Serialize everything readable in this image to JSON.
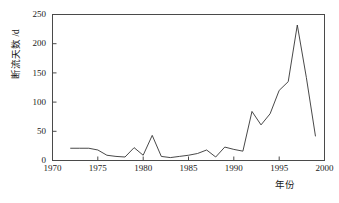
{
  "chart_data": {
    "type": "line",
    "title": "",
    "subtitle": "",
    "xlabel": "年份",
    "ylabel": "断流天数 /d",
    "xlim": [
      1970,
      2000
    ],
    "ylim": [
      0,
      250
    ],
    "grid": false,
    "legend": null,
    "xticks": [
      "1970",
      "1975",
      "1980",
      "1985",
      "1990",
      "1995",
      "2000"
    ],
    "xtick_values": [
      1970,
      1975,
      1980,
      1985,
      1990,
      1995,
      2000
    ],
    "yticks": [
      "0",
      "50",
      "100",
      "150",
      "200",
      "250"
    ],
    "ytick_values": [
      0,
      50,
      100,
      150,
      200,
      250
    ],
    "line_color": "#333333",
    "series": [
      {
        "name": "断流天数",
        "x": [
          1972,
          1973,
          1974,
          1975,
          1976,
          1977,
          1978,
          1979,
          1980,
          1981,
          1982,
          1983,
          1984,
          1985,
          1986,
          1987,
          1988,
          1989,
          1990,
          1991,
          1992,
          1993,
          1994,
          1995,
          1996,
          1997,
          1998,
          1999
        ],
        "values": [
          21,
          21,
          21,
          18,
          9,
          7,
          6,
          22,
          9,
          43,
          7,
          5,
          7,
          9,
          12,
          18,
          6,
          23,
          19,
          16,
          84,
          61,
          80,
          120,
          135,
          232,
          142,
          42
        ]
      }
    ]
  },
  "axis": {
    "y_label_text": "断流天数 /d",
    "x_label_text": "年份"
  }
}
